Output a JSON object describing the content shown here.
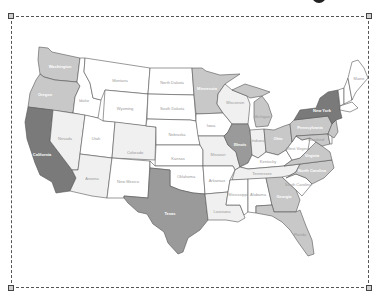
{
  "map": {
    "type": "choropleth",
    "region": "United States",
    "colors": {
      "level0": "#ffffff",
      "level1": "#f0f0f0",
      "level2": "#c8c8c8",
      "level3": "#9a9a9a",
      "level4": "#7a7a7a",
      "border": "#555555"
    },
    "states": {
      "WA": "Washington",
      "OR": "Oregon",
      "CA": "California",
      "ID": "Idaho",
      "NV": "Nevada",
      "MT": "Montana",
      "WY": "Wyoming",
      "UT": "Utah",
      "AZ": "Arizona",
      "CO": "Colorado",
      "NM": "New Mexico",
      "ND": "North Dakota",
      "SD": "South Dakota",
      "NE": "Nebraska",
      "KS": "Kansas",
      "OK": "Oklahoma",
      "TX": "Texas",
      "MN": "Minnesota",
      "IA": "Iowa",
      "MO": "Missouri",
      "AR": "Arkansas",
      "LA": "Louisiana",
      "WI": "Wisconsin",
      "IL": "Illinois",
      "MI": "Michigan",
      "IN": "Indiana",
      "OH": "Ohio",
      "KY": "Kentucky",
      "TN": "Tennessee",
      "MS": "Mississippi",
      "AL": "Alabama",
      "GA": "Georgia",
      "FL": "Florida",
      "SC": "South Carolina",
      "NC": "North Carolina",
      "VA": "Virginia",
      "WV": "West Virginia",
      "PA": "Pennsylvania",
      "NY": "New York",
      "ME": "Maine",
      "NH": "New Hampshire",
      "VT": "Vermont",
      "MA": "Massachusetts",
      "NJ": "New Jersey",
      "MD": "Maryland",
      "DE": "Delaware"
    }
  },
  "selection_frame": {
    "handles": [
      "top-left",
      "top-right",
      "bottom-left",
      "bottom-right"
    ]
  }
}
